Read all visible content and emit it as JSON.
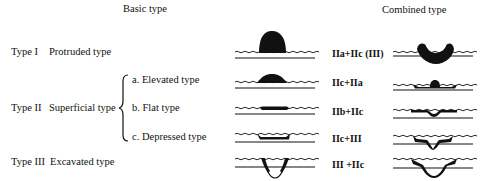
{
  "headers": {
    "basic": "Basic type",
    "combined": "Combined type"
  },
  "basic_types": [
    {
      "type": "Type I",
      "name": "Protruded type"
    },
    {
      "type": "Type II",
      "name": "Superficial type",
      "subtypes": [
        "a. Elevated type",
        "b. Flat type",
        "c. Depressed type"
      ]
    },
    {
      "type": "Type III",
      "name": "Excavated type"
    }
  ],
  "combined_types": [
    "IIa+IIc (III)",
    "IIc+IIa",
    "IIb+IIc",
    "IIc+III",
    "III +IIc"
  ],
  "colors": {
    "ink": "#111111",
    "background": "#ffffff"
  }
}
